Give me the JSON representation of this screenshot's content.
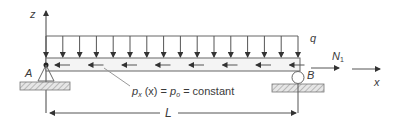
{
  "diagram": {
    "axes": {
      "z_label": "z",
      "x_label": "x"
    },
    "supports": {
      "left_label": "A",
      "right_label": "B",
      "left_type": "pin",
      "right_type": "roller"
    },
    "distributed_load": {
      "label": "q",
      "direction": "down",
      "arrow_count": 16
    },
    "axial_load": {
      "expression_p": "p",
      "expression_sub_x": "x",
      "expression_mid": " (x) = ",
      "expression_p0": "p",
      "expression_sub_0": "o",
      "expression_tail": " = constant",
      "direction": "left",
      "arrow_count": 8
    },
    "end_force": {
      "label": "N",
      "subscript": "1",
      "direction": "right"
    },
    "dimension": {
      "label": "L"
    },
    "colors": {
      "line": "#3a3a3a",
      "beam_fill": "#f4f4f4",
      "hatch": "#8a8a8a"
    }
  }
}
